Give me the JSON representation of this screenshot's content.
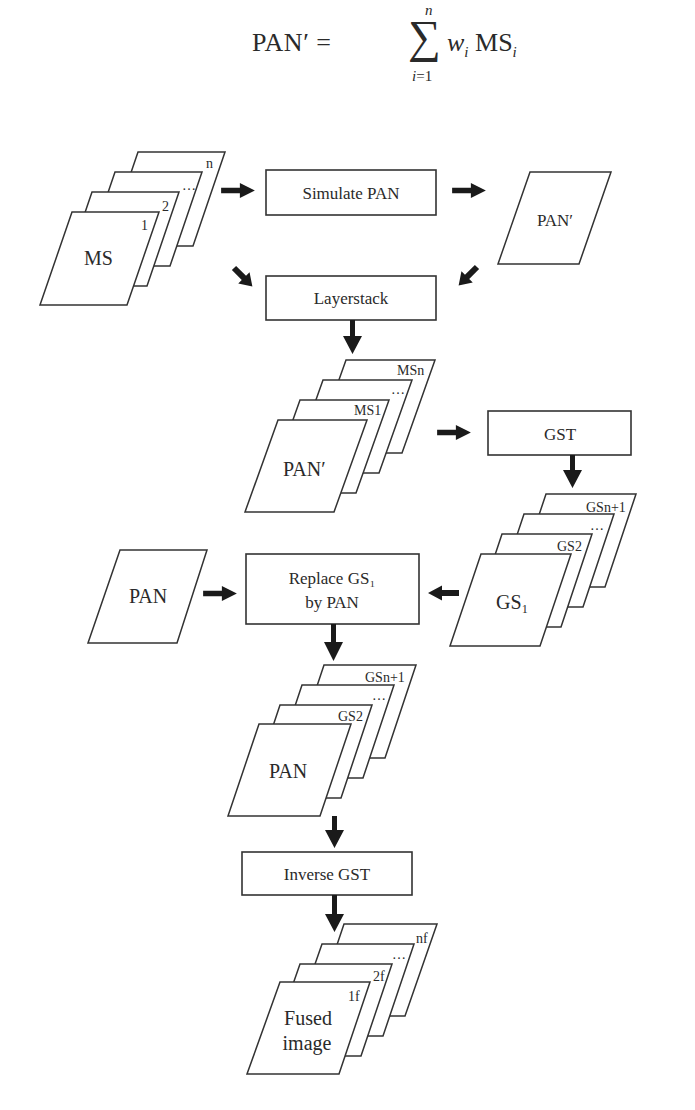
{
  "formula": {
    "lhs": "PAN′ = ",
    "sigma": "∑",
    "upper": "n",
    "lower_var": "i",
    "lower_rest": "=1",
    "weight": "w",
    "weight_sub": "i",
    "term": " MS",
    "term_sub": "i"
  },
  "stacks": {
    "ms": {
      "main": "MS",
      "layers": [
        "1",
        "2",
        "…",
        "n"
      ]
    },
    "layerstack": {
      "main": "PAN′",
      "layers": [
        "MS1",
        "…",
        "MSn"
      ]
    },
    "gs": {
      "main": "GS₁",
      "layers": [
        "GS2",
        "…",
        "GSn+1"
      ]
    },
    "replaced": {
      "main": "PAN",
      "layers": [
        "GS2",
        "…",
        "GSn+1"
      ]
    },
    "fused": {
      "main_line1": "Fused",
      "main_line2": "image",
      "layers": [
        "1f",
        "2f",
        "…",
        "nf"
      ]
    }
  },
  "boxes": {
    "simulate": "Simulate PAN",
    "layerstack": "Layerstack",
    "gst": "GST",
    "replace_line1": "Replace GS₁",
    "replace_line2": "by PAN",
    "inverse": "Inverse GST"
  },
  "single_images": {
    "pan_prime": "PAN′",
    "pan": "PAN"
  },
  "colors": {
    "stroke": "#333333",
    "arrow": "#1a1a1a",
    "text": "#2a2a2a",
    "background": "#ffffff"
  }
}
